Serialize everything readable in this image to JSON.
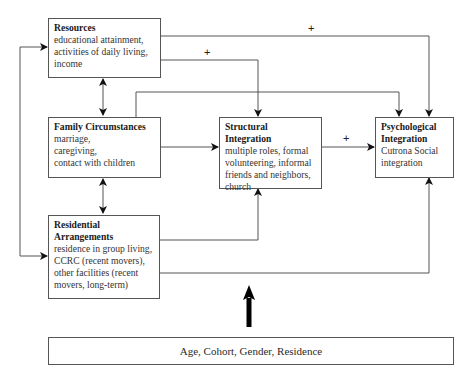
{
  "nodes": {
    "resources": {
      "title": "Resources",
      "lines": [
        "educational attainment,",
        "activities of daily living,",
        "income"
      ]
    },
    "family": {
      "title": "Family Circumstances",
      "lines": [
        "marriage,",
        "caregiving,",
        "contact with children"
      ]
    },
    "residential": {
      "title_lines": [
        "Residential",
        "Arrangements"
      ],
      "lines": [
        "residence in group living,",
        "CCRC (recent movers),",
        "other facilities (recent",
        "movers, long-term)"
      ]
    },
    "structural": {
      "title": "Structural Integration",
      "lines": [
        "multiple roles, formal",
        "volunteering, informal",
        "friends and neighbors,",
        "church"
      ]
    },
    "psychological": {
      "title_lines": [
        "Psychological",
        "Integration"
      ],
      "lines": [
        "Cutrona Social",
        "integration"
      ]
    },
    "controls": {
      "label": "Age, Cohort, Gender, Residence"
    }
  },
  "edge_labels": {
    "resources_to_psych": "+",
    "resources_to_structural": "+",
    "structural_to_psych": "+"
  },
  "edges": [
    {
      "from": "resources",
      "to": "psychological",
      "label": "+"
    },
    {
      "from": "resources",
      "to": "structural",
      "label": "+"
    },
    {
      "from": "resources",
      "to": "family",
      "bidirectional": true
    },
    {
      "from": "family",
      "to": "residential",
      "bidirectional": true
    },
    {
      "from": "residential",
      "to": "resources",
      "bidirectional": true
    },
    {
      "from": "family",
      "to": "psychological"
    },
    {
      "from": "family",
      "to": "structural"
    },
    {
      "from": "structural",
      "to": "psychological",
      "label": "+"
    },
    {
      "from": "residential",
      "to": "structural"
    },
    {
      "from": "residential",
      "to": "psychological"
    },
    {
      "from": "controls",
      "to": "model",
      "style": "thick"
    }
  ]
}
